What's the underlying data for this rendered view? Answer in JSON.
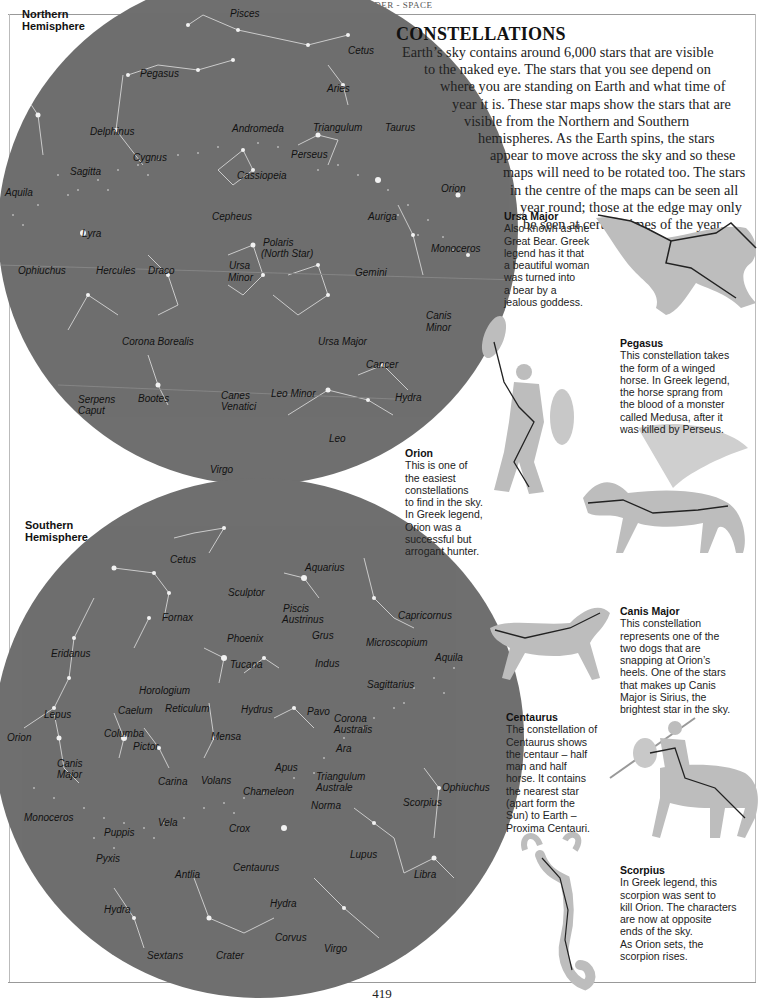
{
  "running_head": "FACT FINDER - SPACE",
  "title": "CONSTELLATIONS",
  "intro_lines": [
    "Earth’s sky contains around 6,000 stars that are visible",
    "to the naked eye. The stars that you see depend on",
    "where you are standing on Earth and what time of",
    "year it is. These star maps show the stars that are",
    "visible from the Northern and Southern",
    "hemispheres. As the Earth spins, the stars",
    "appear to move across the sky and so these",
    "maps will need to be rotated too. The stars",
    "in the centre of the maps can be seen all",
    "year round; those at the edge may only",
    "be seen at certain times of the year."
  ],
  "north_map": {
    "label_line1": "Northern",
    "label_line2": "Hemisphere",
    "constellations": [
      {
        "name": "Pisces",
        "x": 230,
        "y": 8
      },
      {
        "name": "Cetus",
        "x": 348,
        "y": 45
      },
      {
        "name": "Pegasus",
        "x": 140,
        "y": 68
      },
      {
        "name": "Aries",
        "x": 327,
        "y": 83
      },
      {
        "name": "Andromeda",
        "x": 232,
        "y": 123
      },
      {
        "name": "Triangulum",
        "x": 313,
        "y": 122
      },
      {
        "name": "Taurus",
        "x": 385,
        "y": 122
      },
      {
        "name": "Delphinus",
        "x": 90,
        "y": 126
      },
      {
        "name": "Perseus",
        "x": 291,
        "y": 149
      },
      {
        "name": "Cygnus",
        "x": 133,
        "y": 152
      },
      {
        "name": "Sagitta",
        "x": 70,
        "y": 166
      },
      {
        "name": "Cassiopeia",
        "x": 237,
        "y": 170
      },
      {
        "name": "Aquila",
        "x": 5,
        "y": 187
      },
      {
        "name": "Orion",
        "x": 441,
        "y": 183
      },
      {
        "name": "Cepheus",
        "x": 212,
        "y": 211
      },
      {
        "name": "Auriga",
        "x": 368,
        "y": 211
      },
      {
        "name": "Lyra",
        "x": 82,
        "y": 228
      },
      {
        "name": "Polaris",
        "x": 263,
        "y": 237
      },
      {
        "name": "(North Star)",
        "x": 261,
        "y": 248
      },
      {
        "name": "Monoceros",
        "x": 431,
        "y": 243
      },
      {
        "name": "Ophiuchus",
        "x": 18,
        "y": 265
      },
      {
        "name": "Hercules",
        "x": 96,
        "y": 265
      },
      {
        "name": "Draco",
        "x": 148,
        "y": 265
      },
      {
        "name": "Ursa",
        "x": 229,
        "y": 260
      },
      {
        "name": "Minor",
        "x": 228,
        "y": 272
      },
      {
        "name": "Gemini",
        "x": 355,
        "y": 267
      },
      {
        "name": "Canis",
        "x": 426,
        "y": 310
      },
      {
        "name": "Minor",
        "x": 426,
        "y": 322
      },
      {
        "name": "Corona Borealis",
        "x": 122,
        "y": 336
      },
      {
        "name": "Ursa Major",
        "x": 318,
        "y": 336
      },
      {
        "name": "Cancer",
        "x": 366,
        "y": 359
      },
      {
        "name": "Serpens",
        "x": 78,
        "y": 394
      },
      {
        "name": "Caput",
        "x": 78,
        "y": 405
      },
      {
        "name": "Bootes",
        "x": 138,
        "y": 393
      },
      {
        "name": "Canes",
        "x": 221,
        "y": 390
      },
      {
        "name": "Venatici",
        "x": 221,
        "y": 401
      },
      {
        "name": "Leo Minor",
        "x": 271,
        "y": 388
      },
      {
        "name": "Hydra",
        "x": 395,
        "y": 392
      },
      {
        "name": "Leo",
        "x": 329,
        "y": 433
      },
      {
        "name": "Virgo",
        "x": 210,
        "y": 464
      }
    ]
  },
  "south_map": {
    "label_line1": "Southern",
    "label_line2": "Hemisphere",
    "constellations": [
      {
        "name": "Cetus",
        "x": 170,
        "y": 554
      },
      {
        "name": "Aquarius",
        "x": 305,
        "y": 562
      },
      {
        "name": "Sculptor",
        "x": 228,
        "y": 587
      },
      {
        "name": "Piscis",
        "x": 283,
        "y": 603
      },
      {
        "name": "Austrinus",
        "x": 282,
        "y": 614
      },
      {
        "name": "Capricornus",
        "x": 398,
        "y": 610
      },
      {
        "name": "Fornax",
        "x": 162,
        "y": 612
      },
      {
        "name": "Grus",
        "x": 312,
        "y": 630
      },
      {
        "name": "Phoenix",
        "x": 227,
        "y": 633
      },
      {
        "name": "Microscopium",
        "x": 366,
        "y": 637
      },
      {
        "name": "Eridanus",
        "x": 51,
        "y": 648
      },
      {
        "name": "Aquila",
        "x": 435,
        "y": 652
      },
      {
        "name": "Tucana",
        "x": 230,
        "y": 659
      },
      {
        "name": "Indus",
        "x": 315,
        "y": 658
      },
      {
        "name": "Sagittarius",
        "x": 367,
        "y": 679
      },
      {
        "name": "Horologium",
        "x": 139,
        "y": 685
      },
      {
        "name": "Lepus",
        "x": 44,
        "y": 709
      },
      {
        "name": "Caelum",
        "x": 118,
        "y": 705
      },
      {
        "name": "Reticulum",
        "x": 165,
        "y": 703
      },
      {
        "name": "Hydrus",
        "x": 241,
        "y": 704
      },
      {
        "name": "Pavo",
        "x": 307,
        "y": 706
      },
      {
        "name": "Corona",
        "x": 334,
        "y": 713
      },
      {
        "name": "Australis",
        "x": 334,
        "y": 724
      },
      {
        "name": "Orion",
        "x": 7,
        "y": 732
      },
      {
        "name": "Columba",
        "x": 104,
        "y": 728
      },
      {
        "name": "Mensa",
        "x": 211,
        "y": 731
      },
      {
        "name": "Ara",
        "x": 336,
        "y": 743
      },
      {
        "name": "Pictor",
        "x": 133,
        "y": 741
      },
      {
        "name": "Canis",
        "x": 57,
        "y": 758
      },
      {
        "name": "Major",
        "x": 57,
        "y": 769
      },
      {
        "name": "Apus",
        "x": 275,
        "y": 762
      },
      {
        "name": "Carina",
        "x": 158,
        "y": 776
      },
      {
        "name": "Volans",
        "x": 201,
        "y": 775
      },
      {
        "name": "Triangulum",
        "x": 316,
        "y": 771
      },
      {
        "name": "Australe",
        "x": 316,
        "y": 782
      },
      {
        "name": "Ophiuchus",
        "x": 442,
        "y": 782
      },
      {
        "name": "Chameleon",
        "x": 243,
        "y": 786
      },
      {
        "name": "Norma",
        "x": 311,
        "y": 800
      },
      {
        "name": "Scorpius",
        "x": 403,
        "y": 797
      },
      {
        "name": "Monoceros",
        "x": 24,
        "y": 812
      },
      {
        "name": "Vela",
        "x": 158,
        "y": 817
      },
      {
        "name": "Crox",
        "x": 229,
        "y": 823
      },
      {
        "name": "Puppis",
        "x": 104,
        "y": 827
      },
      {
        "name": "Pyxis",
        "x": 96,
        "y": 853
      },
      {
        "name": "Centaurus",
        "x": 233,
        "y": 862
      },
      {
        "name": "Lupus",
        "x": 350,
        "y": 849
      },
      {
        "name": "Antlia",
        "x": 175,
        "y": 869
      },
      {
        "name": "Libra",
        "x": 414,
        "y": 869
      },
      {
        "name": "Hydra",
        "x": 270,
        "y": 898
      },
      {
        "name": "Hydra",
        "x": 104,
        "y": 904
      },
      {
        "name": "Corvus",
        "x": 275,
        "y": 932
      },
      {
        "name": "Virgo",
        "x": 324,
        "y": 943
      },
      {
        "name": "Sextans",
        "x": 147,
        "y": 950
      },
      {
        "name": "Crater",
        "x": 216,
        "y": 950
      }
    ]
  },
  "captions": [
    {
      "id": "ursa-major",
      "title": "Ursa Major",
      "lines": [
        "Also known as the",
        "Great Bear. Greek",
        "legend has it that",
        "a beautiful woman",
        "was turned into",
        "a bear by a",
        "jealous goddess."
      ],
      "x": 504,
      "y": 210
    },
    {
      "id": "pegasus",
      "title": "Pegasus",
      "lines": [
        "This constellation takes",
        "the form of a winged",
        "horse. In Greek legend,",
        "the horse sprang from",
        "the blood of a monster",
        "called Medusa, after it",
        "was killed by Perseus."
      ],
      "x": 620,
      "y": 337
    },
    {
      "id": "orion",
      "title": "Orion",
      "lines": [
        "This is one of",
        "the easiest",
        "constellations",
        "to find in the sky.",
        "In Greek legend,",
        "Orion was a",
        "successful but",
        "arrogant hunter."
      ],
      "x": 405,
      "y": 447
    },
    {
      "id": "canis-major",
      "title": "Canis Major",
      "lines": [
        "This constellation",
        "represents one of the",
        "two dogs that are",
        "snapping at Orion’s",
        "heels. One of the stars",
        "that makes up Canis",
        "Major is Sirius, the",
        "brightest star in the sky."
      ],
      "x": 620,
      "y": 605
    },
    {
      "id": "centaurus",
      "title": "Centaurus",
      "lines": [
        "The constellation of",
        "Centaurus shows",
        "the centaur – half",
        "man and half",
        "horse. It contains",
        "the nearest star",
        "(apart form the",
        "Sun) to Earth –",
        "Proxima Centauri."
      ],
      "x": 506,
      "y": 711
    },
    {
      "id": "scorpius",
      "title": "Scorpius",
      "lines": [
        "In Greek legend, this",
        "scorpion was sent to",
        "kill Orion. The characters",
        "are now at opposite",
        "ends of the sky.",
        "As Orion sets, the",
        "scorpion rises."
      ],
      "x": 620,
      "y": 864
    }
  ],
  "figures": [
    "bear-illustration",
    "orion-hunter-illustration",
    "pegasus-horse-illustration",
    "canis-major-dog-illustration",
    "centaur-illustration",
    "scorpion-illustration"
  ],
  "colors": {
    "sky": "#6f6f6f",
    "star": "#f2f2f2",
    "line": "#d8d8d8",
    "figure": "#bdbdbd"
  },
  "page_number": "419"
}
